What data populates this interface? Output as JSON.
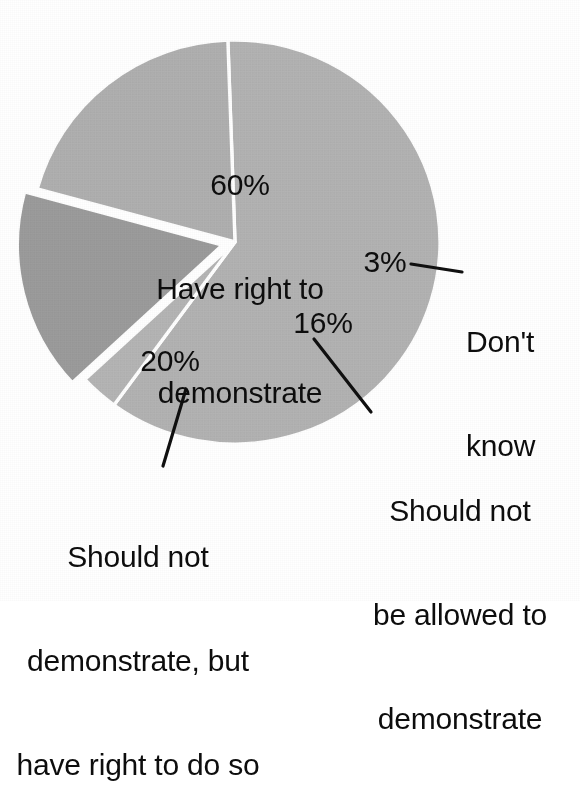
{
  "figure": {
    "name": "opinion-poll-pie-chart",
    "background_color": "#ffffff",
    "text_color": "#0d0d0d",
    "separator_color": "#ffffff"
  },
  "chart_data": {
    "type": "pie",
    "title": "",
    "subtitle": "",
    "xlabel": "",
    "ylabel": "",
    "legend_position": "none",
    "grid": false,
    "units": "percent",
    "total": 99,
    "labels_inside": true,
    "style": {
      "three_d": true,
      "start_angle_deg": 268,
      "direction": "clockwise",
      "exploded_slices": [
        "Should not be allowed to demonstrate"
      ]
    },
    "categories": [
      "Have right to demonstrate",
      "Don't know",
      "Should not be allowed to demonstrate",
      "Should not demonstrate, but have right to do so"
    ],
    "values": [
      60,
      3,
      16,
      20
    ],
    "slices": [
      {
        "id": "have-right",
        "percent": 60,
        "percent_label": "60%",
        "label_lines": [
          "Have right to",
          "demonstrate"
        ],
        "label_text": "Have right to demonstrate",
        "color": "#b3b3b3",
        "rim_color": "#8d8d8d",
        "exploded": false,
        "leader_line": false
      },
      {
        "id": "dont-know",
        "percent": 3,
        "percent_label": "3%",
        "label_lines": [
          "Don't",
          "know"
        ],
        "label_text": "Don't know",
        "color": "#b5b5b5",
        "rim_color": "#8d8d8d",
        "exploded": false,
        "leader_line": true
      },
      {
        "id": "not-allowed",
        "percent": 16,
        "percent_label": "16%",
        "label_lines": [
          "Should not",
          "be allowed to",
          "demonstrate"
        ],
        "label_text": "Should not be allowed to demonstrate",
        "color": "#9c9c9c",
        "rim_color": "#7a7a7a",
        "exploded": true,
        "leader_line": true
      },
      {
        "id": "not-demonstrate-but-right",
        "percent": 20,
        "percent_label": "20%",
        "label_lines": [
          "Should not",
          "demonstrate, but",
          "have right to do so"
        ],
        "label_text": "Should not demonstrate, but have right to do so",
        "color": "#b0b0b0",
        "rim_color": "#8d8d8d",
        "exploded": false,
        "leader_line": true
      }
    ]
  }
}
